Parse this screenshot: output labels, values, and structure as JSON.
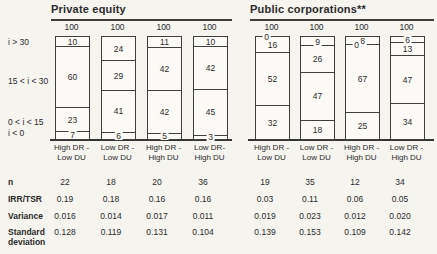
{
  "chart_data": {
    "type": "bar",
    "stacked": true,
    "orientation": "vertical",
    "units": "percent",
    "column_total_label": "100",
    "segment_categories": [
      "i > 30",
      "15 < i < 30",
      "0 < i < 15",
      "i < 0"
    ],
    "groups": [
      {
        "title": "Private equity",
        "bars": [
          {
            "category_lines": [
              "High DR -",
              "Low DU"
            ],
            "total": 100,
            "segments": [
              10,
              60,
              23,
              7
            ]
          },
          {
            "category_lines": [
              "Low DR -",
              "Low DU"
            ],
            "total": 100,
            "segments": [
              24,
              29,
              41,
              6
            ]
          },
          {
            "category_lines": [
              "High DR -",
              "High DU"
            ],
            "total": 100,
            "segments": [
              11,
              42,
              42,
              5
            ]
          },
          {
            "category_lines": [
              "Low DR-",
              "High DU"
            ],
            "total": 100,
            "segments": [
              10,
              42,
              45,
              3
            ]
          }
        ]
      },
      {
        "title": "Public corporations**",
        "bars": [
          {
            "category_lines": [
              "High DR -",
              "Low DU"
            ],
            "total": 100,
            "segments": [
              0,
              16,
              52,
              32
            ]
          },
          {
            "category_lines": [
              "Low DR -",
              "Low DU"
            ],
            "total": 100,
            "segments": [
              9,
              26,
              47,
              18
            ]
          },
          {
            "category_lines": [
              "High DR -",
              "High DU"
            ],
            "total": 100,
            "segments": [
              8,
              0,
              67,
              25
            ]
          },
          {
            "category_lines": [
              "Low DR -",
              "High DU"
            ],
            "total": 100,
            "segments": [
              6,
              13,
              47,
              34
            ]
          }
        ]
      }
    ]
  },
  "table": {
    "rows": [
      {
        "label": "n",
        "values": [
          "22",
          "18",
          "20",
          "36",
          "19",
          "35",
          "12",
          "34"
        ]
      },
      {
        "label": "IRR/TSR",
        "values": [
          "0.19",
          "0.18",
          "0.16",
          "0.16",
          "0.03",
          "0.11",
          "0.06",
          "0.05"
        ]
      },
      {
        "label": "Variance",
        "values": [
          "0.016",
          "0.014",
          "0.017",
          "0.011",
          "0.019",
          "0.023",
          "0.012",
          "0.020"
        ]
      },
      {
        "label": "Standard deviation",
        "values": [
          "0.128",
          "0.119",
          "0.131",
          "0.104",
          "0.139",
          "0.153",
          "0.109",
          "0.142"
        ]
      }
    ]
  },
  "colors": {
    "background": "#f5f4ef",
    "ink": "#2b2b2b",
    "line": "#3c3c3c",
    "bar_fill": "#fbfaf6"
  }
}
